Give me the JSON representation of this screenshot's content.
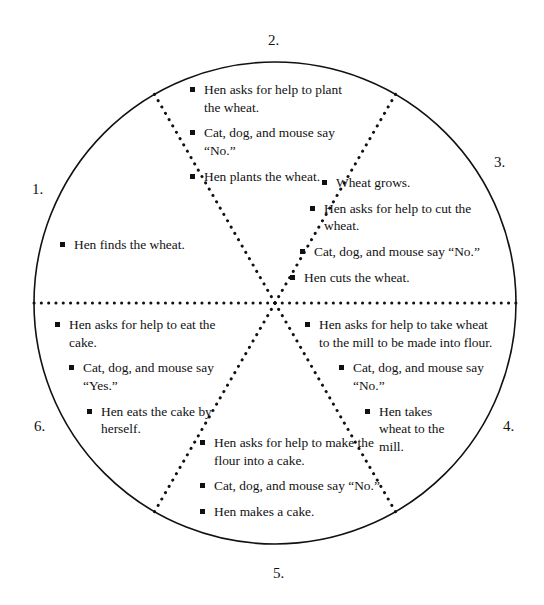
{
  "diagram": {
    "type": "story-sequence-wheel",
    "shape": "circle",
    "sector_count": 6,
    "outline_color": "#111111",
    "divider_style": "dotted",
    "center": {
      "x": 275,
      "y": 303
    },
    "radius": 241
  },
  "sectors": [
    {
      "number": "1.",
      "position": "left",
      "bullets": [
        "Hen finds the wheat."
      ]
    },
    {
      "number": "2.",
      "position": "top",
      "bullets": [
        "Hen asks for help to plant the wheat.",
        "Cat, dog, and mouse say “No.”",
        "Hen plants the wheat."
      ]
    },
    {
      "number": "3.",
      "position": "upper-right",
      "bullets": [
        "Wheat grows.",
        "Hen asks for help to cut the wheat.",
        "Cat, dog, and mouse say “No.”",
        "Hen cuts the wheat."
      ]
    },
    {
      "number": "4.",
      "position": "lower-right",
      "bullets": [
        "Hen asks for help to take wheat to the mill to be made into flour.",
        "Cat, dog, and mouse say “No.”",
        "Hen takes wheat to the mill."
      ]
    },
    {
      "number": "5.",
      "position": "bottom",
      "bullets": [
        "Hen asks for help to make the flour into a cake.",
        "Cat, dog, and mouse say “No.”",
        "Hen makes a cake."
      ]
    },
    {
      "number": "6.",
      "position": "lower-left",
      "bullets": [
        "Hen asks for help to eat the cake.",
        "Cat, dog, and mouse say “Yes.”",
        "Hen eats the cake by herself."
      ]
    }
  ]
}
